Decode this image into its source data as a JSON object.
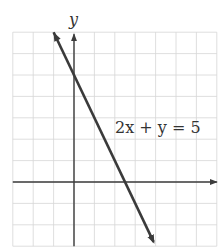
{
  "chart_data": {
    "type": "line",
    "title": "",
    "xlabel": "",
    "ylabel": "y",
    "equation_label": "2x + y = 5",
    "grid": true,
    "xlim": [
      -3,
      7
    ],
    "ylim": [
      -3,
      7
    ],
    "x_tick_step": 1,
    "y_tick_step": 1,
    "tick_labels_shown": false,
    "series": [
      {
        "name": "2x + y = 5",
        "equation": "y = -2x + 5",
        "slope": -2,
        "y_intercept": 5,
        "x_intercept": 2.5,
        "x": [
          -1,
          3.9
        ],
        "y": [
          7,
          -2.8
        ],
        "arrows_both_ends": true
      }
    ],
    "legend": null
  },
  "colors": {
    "grid": "#d6d6d6",
    "axis": "#3c3c3c",
    "line": "#3a3a3a",
    "text": "#333333"
  }
}
